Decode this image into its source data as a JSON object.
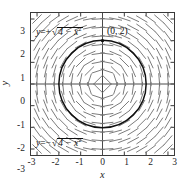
{
  "figure": {
    "kind": "slope-field-plot",
    "background": "#ffffff",
    "frame_color": "#3a3a3a",
    "curve_color": "#111111",
    "field_color": "#6a6a6a",
    "axis_color": "#4a4a4a"
  },
  "axes": {
    "x_name": "x",
    "y_name": "y",
    "x_ticks": [
      "-3",
      "-2",
      "-1",
      "0",
      "1",
      "2",
      "3"
    ],
    "y_ticks": [
      "3",
      "2",
      "1",
      "0",
      "-1",
      "-2",
      "-3"
    ],
    "x_tick_values": [
      -3,
      -2,
      -1,
      0,
      1,
      2,
      3
    ],
    "y_tick_values": [
      3,
      2,
      1,
      0,
      -1,
      -2,
      -3
    ]
  },
  "annotations": {
    "upper_curve": {
      "lhs": "y",
      "eq": "=",
      "sign": "+",
      "radicand": "4 − x",
      "exponent": "2"
    },
    "lower_curve": {
      "lhs": "y",
      "eq": "=",
      "sign": "−",
      "radicand": "4 − x",
      "exponent": "2"
    },
    "point": "(0, 2)"
  },
  "chart_data": {
    "type": "scatter",
    "title": "",
    "subtitle": "",
    "xlabel": "x",
    "ylabel": "y",
    "xlim": [
      -3.3,
      3.3
    ],
    "ylim": [
      -3.3,
      3.3
    ],
    "grid": false,
    "legend": "none",
    "slope_field": {
      "equation": "dy/dx = -x/y",
      "x_samples": [
        -3.0,
        -2.6,
        -2.2,
        -1.8,
        -1.4,
        -1.0,
        -0.6,
        -0.2,
        0.2,
        0.6,
        1.0,
        1.4,
        1.8,
        2.2,
        2.6,
        3.0
      ],
      "y_samples": [
        3.0,
        2.6,
        2.2,
        1.8,
        1.4,
        1.0,
        0.6,
        0.2,
        -0.2,
        -0.6,
        -1.0,
        -1.4,
        -1.8,
        -2.2,
        -2.6,
        -3.0
      ],
      "segment_length": 0.3
    },
    "solution_curve": {
      "name": "x^2 + y^2 = 4",
      "shape": "circle",
      "center": [
        0,
        0
      ],
      "radius": 2,
      "upper_branch": "y = +sqrt(4 - x^2)",
      "lower_branch": "y = -sqrt(4 - x^2)"
    },
    "marked_points": [
      {
        "label": "(0, 2)",
        "x": 0,
        "y": 2
      }
    ]
  }
}
